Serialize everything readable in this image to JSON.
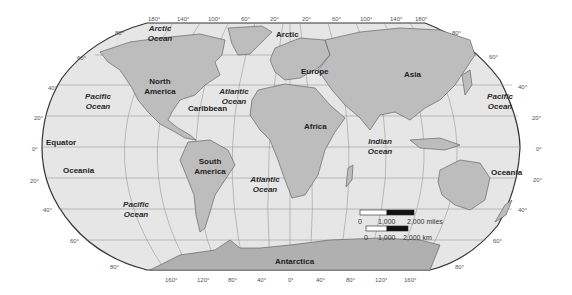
{
  "map": {
    "projection": "Robinson",
    "colors": {
      "background": "#ffffff",
      "ocean": "#e6e6e6",
      "land": "#bdbdbd",
      "land_dark": "#a8a8a8",
      "border": "#555555",
      "graticule": "#8a8a8a",
      "outline": "#333333"
    },
    "top_longitude_ticks": [
      "180°",
      "140°",
      "100°",
      "60°",
      "20°",
      "20°",
      "60°",
      "100°",
      "140°",
      "180°"
    ],
    "bottom_longitude_ticks": [
      "160°",
      "120°",
      "80°",
      "40°",
      "0°",
      "40°",
      "80°",
      "120°",
      "160°"
    ],
    "left_latitude_ticks": [
      "80°",
      "60°",
      "40°",
      "20°",
      "0°",
      "20°",
      "40°",
      "60°",
      "80°"
    ],
    "right_latitude_ticks": [
      "80°",
      "60°",
      "40°",
      "20°",
      "0°",
      "20°",
      "40°",
      "60°",
      "80°"
    ],
    "continents": {
      "north_america": "North America",
      "south_america": "South America",
      "europe": "Europe",
      "africa": "Africa",
      "asia": "Asia",
      "antarctica": "Antarctica"
    },
    "regions": {
      "caribbean": "Caribbean",
      "equator": "Equator",
      "oceania_left": "Oceania",
      "oceania_right": "Oceania",
      "arctic": "Arctic"
    },
    "oceans": {
      "arctic_ocean": "Arctic Ocean",
      "pacific_nw": "Pacific Ocean",
      "pacific_ne": "Pacific Ocean",
      "pacific_sw": "Pacific Ocean",
      "atlantic_north": "Atlantic Ocean",
      "atlantic_south": "Atlantic Ocean",
      "indian": "Indian Ocean"
    },
    "scale": {
      "miles": {
        "zero": "0",
        "mid": "1,000",
        "end": "2,000 miles"
      },
      "km": {
        "zero": "0",
        "mid": "1,000",
        "end": "2,000 km"
      }
    }
  }
}
